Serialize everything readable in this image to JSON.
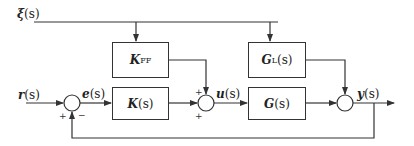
{
  "diagram": {
    "type": "control-system-block-diagram",
    "signals": {
      "disturbance": {
        "symbol": "ξ",
        "arg": "(s)"
      },
      "reference": {
        "symbol": "r",
        "arg": "(s)"
      },
      "error": {
        "symbol": "e",
        "arg": "(s)"
      },
      "control": {
        "symbol": "u",
        "arg": "(s)"
      },
      "output": {
        "symbol": "y",
        "arg": "(s)"
      }
    },
    "blocks": {
      "feedforward": {
        "main": "K",
        "sub": "FF",
        "arg": ""
      },
      "controller": {
        "main": "K",
        "sub": "",
        "arg": "(s)"
      },
      "disturbance_model": {
        "main": "G",
        "sub": "L",
        "arg": "(s)"
      },
      "plant": {
        "main": "G",
        "sub": "",
        "arg": "(s)"
      }
    },
    "summing_junctions": {
      "error_sum": {
        "signs": [
          "+",
          "−"
        ]
      },
      "control_sum": {
        "signs": [
          "+",
          "+"
        ]
      },
      "output_sum": {
        "signs": []
      }
    },
    "colors": {
      "line": "#333333",
      "background": "#ffffff",
      "text": "#222222"
    }
  }
}
